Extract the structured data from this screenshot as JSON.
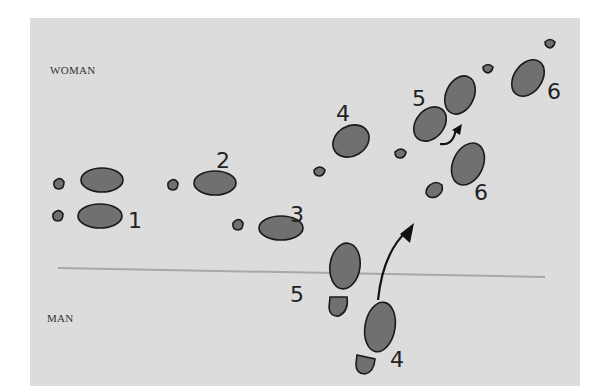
{
  "diagram": {
    "labels": {
      "woman": "WOMAN",
      "man": "MAN"
    },
    "step_numbers": {
      "woman": [
        "2",
        "4",
        "5",
        "6"
      ],
      "man": [
        "1",
        "3",
        "5",
        "6",
        "4"
      ]
    },
    "colors": {
      "background": "#dcdcdc",
      "footprint_fill": "#707070",
      "outline": "#1a1a1a",
      "divider_line": "#a8a8a8"
    }
  }
}
